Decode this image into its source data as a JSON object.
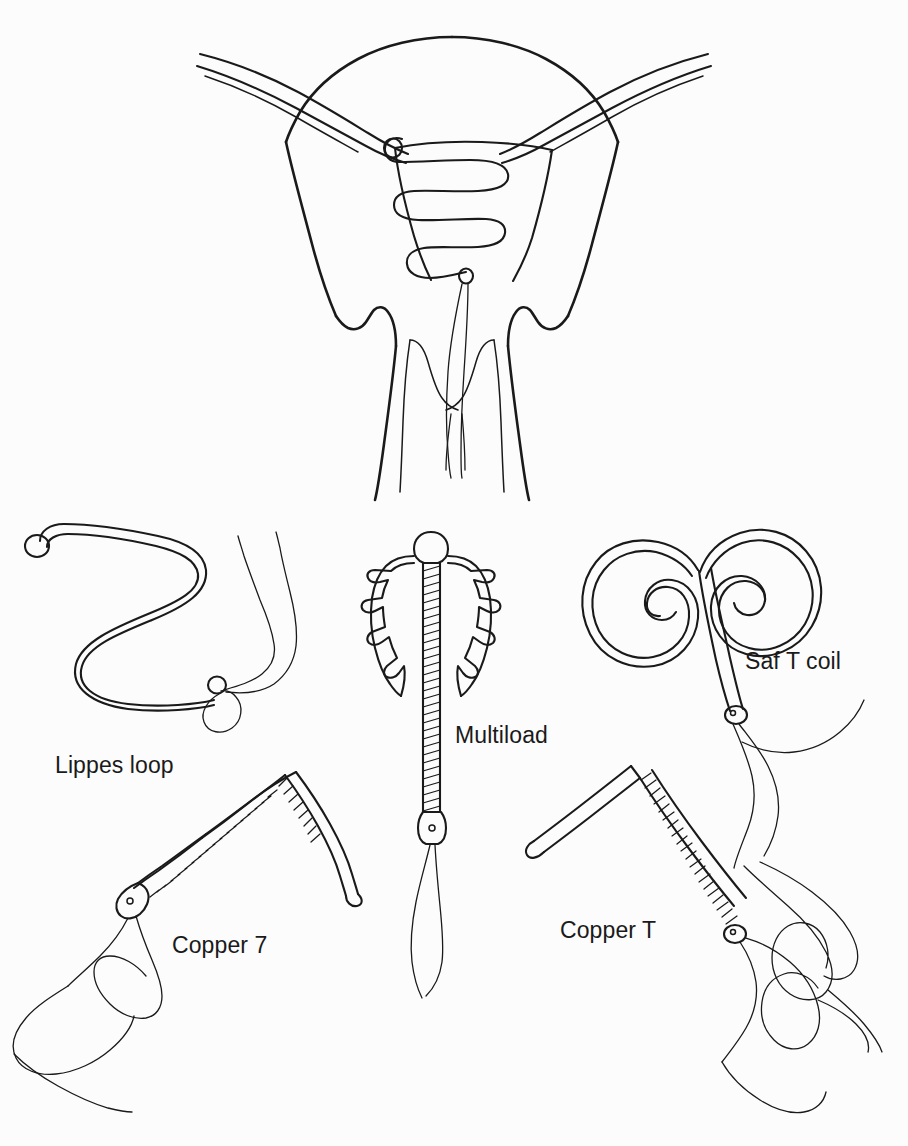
{
  "figure": {
    "background_color": "#fcfcfc",
    "line_color": "#1a1a1a"
  },
  "anatomy": {
    "name": "uterus-cross-section",
    "description": "Coronal cross-section of uterus, fallopian tubes, cervix and upper vagina with an intrauterine device in situ",
    "parts": [
      "uterine-fundus",
      "fallopian-tube-left",
      "fallopian-tube-right",
      "uterine-cavity",
      "iud-in-situ",
      "cervical-canal",
      "cervix",
      "vaginal-fornix-left",
      "vaginal-fornix-right",
      "iud-strings"
    ]
  },
  "devices": [
    {
      "id": "lippes-loop",
      "label": "Lippes loop",
      "label_x": 55,
      "label_y": 752,
      "material": "plastic",
      "has_copper": false
    },
    {
      "id": "multiload",
      "label": "Multiload",
      "label_x": 455,
      "label_y": 722,
      "material": "plastic with copper wire",
      "has_copper": true
    },
    {
      "id": "saf-t-coil",
      "label": "Saf T coil",
      "label_x": 745,
      "label_y": 648,
      "material": "plastic",
      "has_copper": false
    },
    {
      "id": "copper-7",
      "label": "Copper 7",
      "label_x": 172,
      "label_y": 932,
      "material": "plastic with copper wire",
      "has_copper": true
    },
    {
      "id": "copper-t",
      "label": "Copper T",
      "label_x": 560,
      "label_y": 917,
      "material": "plastic with copper wire",
      "has_copper": true
    }
  ]
}
